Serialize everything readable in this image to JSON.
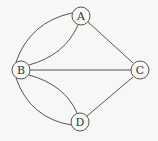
{
  "graph": {
    "nodes": [
      {
        "id": "A",
        "label": "A",
        "x": 81,
        "y": 16
      },
      {
        "id": "B",
        "label": "B",
        "x": 21,
        "y": 70
      },
      {
        "id": "C",
        "label": "C",
        "x": 140,
        "y": 70
      },
      {
        "id": "D",
        "label": "D",
        "x": 80,
        "y": 122
      }
    ],
    "edges": [
      {
        "from": "A",
        "to": "B",
        "curve": "outer"
      },
      {
        "from": "A",
        "to": "B",
        "curve": "inner"
      },
      {
        "from": "A",
        "to": "C",
        "curve": "straight"
      },
      {
        "from": "B",
        "to": "C",
        "curve": "straight"
      },
      {
        "from": "B",
        "to": "D",
        "curve": "outer"
      },
      {
        "from": "B",
        "to": "D",
        "curve": "inner"
      },
      {
        "from": "C",
        "to": "D",
        "curve": "straight"
      }
    ],
    "node_radius": 9,
    "stroke_color": "#555555"
  }
}
